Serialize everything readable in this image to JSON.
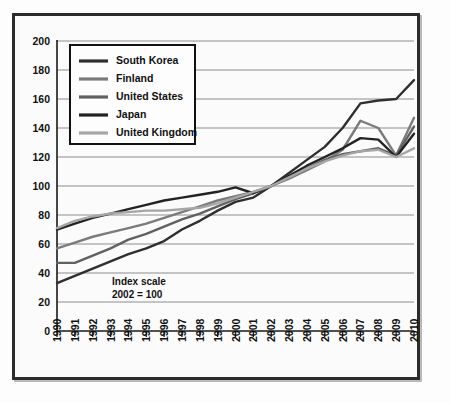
{
  "chart_data": {
    "type": "line",
    "title": "",
    "subtitle": "",
    "xlabel": "",
    "ylabel": "",
    "annotation": "Index scale\n2002 = 100",
    "annotation_line1": "Index scale",
    "annotation_line2": "2002 = 100",
    "grid": "horizontal",
    "legend_position": "upper-left",
    "ylim": [
      0,
      200
    ],
    "yticks": [
      0,
      20,
      40,
      60,
      80,
      100,
      120,
      140,
      160,
      180,
      200
    ],
    "ytick_labels": [
      "0",
      "20",
      "40",
      "60",
      "80",
      "100",
      "120",
      "140",
      "160",
      "180",
      "200"
    ],
    "x": [
      1990,
      1991,
      1992,
      1993,
      1994,
      1995,
      1996,
      1997,
      1998,
      1999,
      2000,
      2001,
      2002,
      2003,
      2004,
      2005,
      2006,
      2007,
      2008,
      2009,
      2010
    ],
    "xtick_labels": [
      "1990",
      "1991",
      "1992",
      "1993",
      "1994",
      "1995",
      "1996",
      "1997",
      "1998",
      "1999",
      "2000",
      "2001",
      "2002",
      "2003",
      "2004",
      "2005",
      "2006",
      "2007",
      "2008",
      "2009",
      "2010"
    ],
    "series": [
      {
        "name": "South Korea",
        "color": "#2f2f2f",
        "values": [
          33,
          38,
          43,
          48,
          53,
          57,
          62,
          70,
          76,
          83,
          89,
          92,
          100,
          109,
          118,
          127,
          140,
          157,
          159,
          160,
          173
        ]
      },
      {
        "name": "Finland",
        "color": "#7b7b7b",
        "values": [
          57,
          61,
          65,
          68,
          71,
          74,
          78,
          82,
          86,
          90,
          93,
          96,
          100,
          105,
          111,
          117,
          125,
          145,
          140,
          121,
          147
        ]
      },
      {
        "name": "United States",
        "color": "#616161",
        "values": [
          47,
          47,
          52,
          57,
          63,
          67,
          72,
          77,
          81,
          86,
          91,
          95,
          100,
          106,
          112,
          118,
          122,
          124,
          126,
          121,
          141
        ]
      },
      {
        "name": "Japan",
        "color": "#232323",
        "values": [
          70,
          74,
          78,
          81,
          84,
          87,
          90,
          92,
          94,
          96,
          99,
          95,
          100,
          107,
          114,
          120,
          126,
          133,
          132,
          120,
          136
        ]
      },
      {
        "name": "United Kingdom",
        "color": "#a6a6a6",
        "values": [
          71,
          76,
          79,
          81,
          82,
          83,
          83,
          84,
          85,
          88,
          92,
          96,
          100,
          106,
          112,
          117,
          121,
          124,
          125,
          120,
          126
        ]
      }
    ]
  }
}
